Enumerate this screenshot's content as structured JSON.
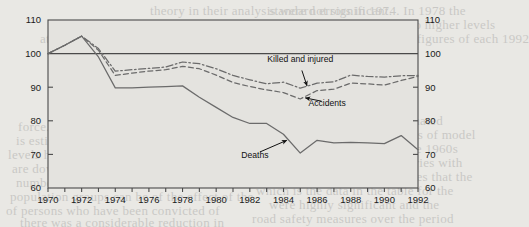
{
  "chart_data": {
    "type": "line",
    "title": "",
    "subtitle": "",
    "xlabel": "",
    "ylabel": "",
    "index_base": 100,
    "xlim": [
      1970,
      1992
    ],
    "ylim": [
      60,
      110
    ],
    "yticks": [
      60,
      70,
      80,
      90,
      100,
      110
    ],
    "xticks": [
      1970,
      1971,
      1972,
      1973,
      1974,
      1975,
      1976,
      1977,
      1978,
      1979,
      1980,
      1981,
      1982,
      1983,
      1984,
      1985,
      1986,
      1987,
      1988,
      1989,
      1990,
      1991,
      1992
    ],
    "xtick_labels": [
      "1970",
      "1972",
      "1974",
      "1976",
      "1978",
      "1980",
      "1982",
      "1984",
      "1986",
      "1988",
      "1990",
      "1992"
    ],
    "xtick_label_years": [
      1970,
      1972,
      1974,
      1976,
      1978,
      1980,
      1982,
      1984,
      1986,
      1988,
      1990,
      1992
    ],
    "ytick_labels_left": [
      "110",
      "100",
      "90",
      "80",
      "70",
      "60"
    ],
    "ytick_labels_right": [
      "110",
      "100",
      "90",
      "80",
      "70",
      "60"
    ],
    "grid": false,
    "reference_line": 100,
    "legend_position": "inline-annotations",
    "x": [
      1970,
      1971,
      1972,
      1973,
      1974,
      1975,
      1976,
      1977,
      1978,
      1979,
      1980,
      1981,
      1982,
      1983,
      1984,
      1985,
      1986,
      1987,
      1988,
      1989,
      1990,
      1991,
      1992
    ],
    "series": [
      {
        "name": "Killed and injured",
        "style": "dash-dot",
        "color": "#6b6b6b",
        "values": [
          100,
          102.5,
          105.2,
          101.5,
          94.8,
          95.2,
          95.6,
          96.0,
          97.5,
          97.0,
          95.5,
          93.5,
          92.2,
          91.0,
          91.5,
          89.7,
          91.2,
          91.6,
          93.6,
          93.2,
          93.0,
          93.4,
          93.5
        ]
      },
      {
        "name": "Accidents",
        "style": "dashed",
        "color": "#6b6b6b",
        "values": [
          100,
          102.5,
          105.2,
          101.0,
          93.5,
          94.2,
          94.8,
          95.2,
          96.2,
          95.5,
          93.6,
          91.4,
          90.2,
          89.2,
          88.4,
          86.5,
          89.0,
          89.4,
          91.2,
          91.0,
          90.6,
          92.0,
          93.2
        ]
      },
      {
        "name": "Deaths",
        "style": "solid",
        "color": "#6b6b6b",
        "values": [
          100,
          102.5,
          105.2,
          99.0,
          89.8,
          89.8,
          90.0,
          90.2,
          90.4,
          87.0,
          84.0,
          81.0,
          79.2,
          79.2,
          76.0,
          70.4,
          74.2,
          73.4,
          73.6,
          73.4,
          73.2,
          75.6,
          71.4
        ]
      }
    ],
    "annotations": [
      {
        "text": "Killed and injured",
        "label_x": 1985.0,
        "label_y": 97.6,
        "point_x": 1985.4,
        "point_y": 90.4
      },
      {
        "text": "Accidents",
        "label_x": 1986.6,
        "label_y": 84.3,
        "point_x": 1985.3,
        "point_y": 86.8
      },
      {
        "text": "Deaths",
        "label_x": 1982.3,
        "label_y": 69.0,
        "point_x": 1984.2,
        "point_y": 74.2
      }
    ]
  },
  "bleed_text": {
    "lines": [
      {
        "x": 150,
        "y": 2,
        "t": "theory in their analysis were not significant."
      },
      {
        "x": 96,
        "y": 16,
        "t": "implications they find it to be less likely in societies"
      },
      {
        "x": 40,
        "y": 30,
        "t": "at which it is seen as being beneficial for a firm to"
      },
      {
        "x": 262,
        "y": 2,
        "t": "  standard errors in 1974. In 1978 the"
      },
      {
        "x": 268,
        "y": 16,
        "t": "S. and that of U.K. South to higher levels"
      },
      {
        "x": 276,
        "y": 30,
        "t": "quantity of annual traffic figures of each 1992"
      },
      {
        "x": 292,
        "y": 44,
        "t": "discuss the findings"
      },
      {
        "x": 18,
        "y": 118,
        "t": "force.  Witness international scale in"
      },
      {
        "x": 16,
        "y": 132,
        "t": "is estimated to have been by 30 and 50 percent"
      },
      {
        "x": 8,
        "y": 146,
        "t": "levels have been by a much as 30 per cent"
      },
      {
        "x": 12,
        "y": 160,
        "t": "are down to the levels which the indicators"
      },
      {
        "x": 16,
        "y": 174,
        "t": "number of fatalities in EC/EU estimates in a"
      },
      {
        "x": 10,
        "y": 188,
        "t": "population groups can be of the effect of the"
      },
      {
        "x": 6,
        "y": 202,
        "t": "of persons who have been convicted of"
      },
      {
        "x": 258,
        "y": 112,
        "t": "ing on the values of the estimated"
      },
      {
        "x": 266,
        "y": 126,
        "t": "coefficients for the variables of model"
      },
      {
        "x": 262,
        "y": 140,
        "t": "All models in the table in the 1960s"
      },
      {
        "x": 258,
        "y": 154,
        "t": "and the relationship to countries with"
      },
      {
        "x": 262,
        "y": 168,
        "t": "and traffic figures, it indicates that the"
      },
      {
        "x": 256,
        "y": 182,
        "t": "which is the data in the table for the"
      },
      {
        "x": 262,
        "y": 196,
        "t": "  were highly significant and the"
      },
      {
        "x": 252,
        "y": 210,
        "t": "road safety measures over the period"
      },
      {
        "x": 20,
        "y": 214,
        "t": "there was a considerable reduction in"
      }
    ]
  }
}
